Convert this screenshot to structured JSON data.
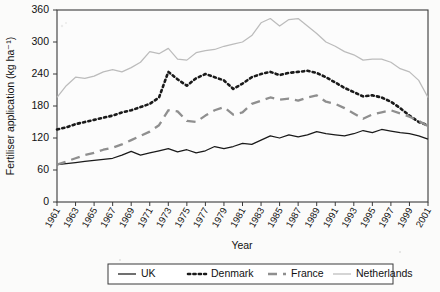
{
  "chart_data": {
    "type": "line",
    "title": "",
    "xlabel": "Year",
    "ylabel": "Fertiliser application (kg ha⁻¹)",
    "xlim": [
      1961,
      2001
    ],
    "ylim": [
      0,
      360
    ],
    "yticks": [
      0,
      60,
      120,
      180,
      240,
      300,
      360
    ],
    "xticks": [
      1961,
      1963,
      1965,
      1967,
      1969,
      1971,
      1973,
      1975,
      1977,
      1979,
      1981,
      1983,
      1985,
      1987,
      1989,
      1991,
      1993,
      1995,
      1997,
      1999,
      2001
    ],
    "xtick_labels": [
      "1961",
      "1963",
      "1965",
      "1967",
      "1969",
      "1971",
      "1973",
      "1975",
      "1977",
      "1979",
      "1981",
      "1983",
      "1985",
      "1987",
      "1989",
      "1991",
      "1993",
      "1995",
      "1997",
      "1999",
      "2001"
    ],
    "grid": false,
    "legend_position": "bottom",
    "x": [
      1961,
      1962,
      1963,
      1964,
      1965,
      1966,
      1967,
      1968,
      1969,
      1970,
      1971,
      1972,
      1973,
      1974,
      1975,
      1976,
      1977,
      1978,
      1979,
      1980,
      1981,
      1982,
      1983,
      1984,
      1985,
      1986,
      1987,
      1988,
      1989,
      1990,
      1991,
      1992,
      1993,
      1994,
      1995,
      1996,
      1997,
      1998,
      1999,
      2000,
      2001
    ],
    "series": [
      {
        "name": "UK",
        "color": "#1a1a1a",
        "style": "solid",
        "values": [
          70,
          72,
          74,
          76,
          78,
          80,
          82,
          88,
          95,
          88,
          92,
          96,
          100,
          94,
          98,
          92,
          96,
          104,
          100,
          104,
          110,
          108,
          116,
          124,
          120,
          126,
          122,
          126,
          132,
          128,
          126,
          124,
          128,
          134,
          130,
          136,
          133,
          130,
          128,
          124,
          118
        ]
      },
      {
        "name": "Denmark",
        "color": "#1a1a1a",
        "style": "dotted",
        "values": [
          136,
          140,
          146,
          150,
          154,
          158,
          162,
          168,
          172,
          178,
          184,
          196,
          244,
          230,
          218,
          232,
          240,
          234,
          228,
          212,
          222,
          234,
          240,
          244,
          238,
          242,
          244,
          246,
          242,
          234,
          224,
          214,
          206,
          198,
          200,
          196,
          188,
          176,
          162,
          150,
          144
        ]
      },
      {
        "name": "France",
        "color": "#8f8f8f",
        "style": "dashed",
        "values": [
          70,
          76,
          82,
          88,
          92,
          98,
          102,
          108,
          116,
          124,
          132,
          144,
          172,
          170,
          152,
          150,
          162,
          172,
          178,
          164,
          168,
          184,
          190,
          196,
          192,
          194,
          190,
          196,
          200,
          188,
          184,
          176,
          166,
          156,
          164,
          168,
          172,
          166,
          160,
          152,
          142
        ]
      },
      {
        "name": "Netherlands",
        "color": "#bcbcbc",
        "style": "solid",
        "values": [
          196,
          218,
          234,
          232,
          236,
          244,
          248,
          244,
          252,
          262,
          282,
          278,
          288,
          268,
          266,
          280,
          284,
          286,
          292,
          296,
          300,
          312,
          336,
          344,
          330,
          342,
          344,
          330,
          316,
          300,
          292,
          282,
          276,
          266,
          268,
          268,
          262,
          250,
          244,
          228,
          196
        ]
      }
    ]
  },
  "legend": {
    "entries": [
      {
        "label": "UK"
      },
      {
        "label": "Denmark"
      },
      {
        "label": "France"
      },
      {
        "label": "Netherlands"
      }
    ]
  }
}
